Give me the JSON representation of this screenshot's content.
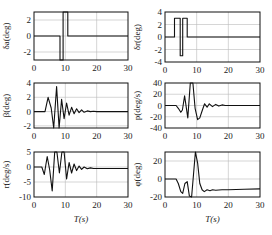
{
  "chart_data": [
    {
      "type": "line",
      "panel": "top-left",
      "ylabel": "δa(deg)",
      "xlabel": "",
      "xlim": [
        0,
        30
      ],
      "ylim": [
        -3,
        3
      ],
      "xticks": [
        "0",
        "10",
        "20",
        "30"
      ],
      "yticks": [
        "2",
        "0",
        "-2"
      ],
      "grid": true,
      "series": [
        {
          "name": "delta_a",
          "x": [
            0,
            8.3,
            8.3,
            9.3,
            9.3,
            9.8,
            9.8,
            10.8,
            10.8,
            30
          ],
          "y": [
            0,
            0,
            -3,
            -3,
            3,
            3,
            3,
            3,
            0,
            0
          ]
        }
      ]
    },
    {
      "type": "line",
      "panel": "top-right",
      "ylabel": "δr(deg)",
      "xlabel": "",
      "xlim": [
        0,
        30
      ],
      "ylim": [
        -4,
        4
      ],
      "xticks": [
        "0",
        "10",
        "20",
        "30"
      ],
      "yticks": [
        "4",
        "2",
        "0",
        "-2",
        "-4"
      ],
      "grid": true,
      "series": [
        {
          "name": "delta_r",
          "x": [
            0,
            3,
            3,
            4.8,
            4.8,
            5.6,
            5.6,
            6.3,
            6.3,
            7,
            7,
            30
          ],
          "y": [
            0,
            0,
            3,
            3,
            -3,
            -3,
            3,
            3,
            3,
            3,
            0,
            0
          ]
        }
      ]
    },
    {
      "type": "line",
      "panel": "middle-left",
      "ylabel": "β(deg)",
      "xlabel": "",
      "xlim": [
        0,
        30
      ],
      "ylim": [
        -2.3,
        4
      ],
      "xticks": [
        "0",
        "10",
        "20",
        "30"
      ],
      "yticks": [
        "4",
        "2",
        "0",
        "-2"
      ],
      "grid": true,
      "series": [
        {
          "name": "beta",
          "x": [
            0,
            3.5,
            4.5,
            5.5,
            6.3,
            7.2,
            8.0,
            8.8,
            9.6,
            10.4,
            11.2,
            12,
            12.8,
            13.6,
            14.4,
            15.2,
            16,
            17,
            18,
            19,
            20,
            30
          ],
          "y": [
            0,
            0,
            2,
            0.5,
            -2.3,
            3.5,
            -2.3,
            1.7,
            -1.0,
            1.2,
            -0.5,
            0.6,
            -0.3,
            0.4,
            -0.15,
            0.25,
            -0.1,
            0.1,
            0,
            0.05,
            0,
            0
          ]
        }
      ]
    },
    {
      "type": "line",
      "panel": "middle-right",
      "ylabel": "p(deg/s)",
      "xlabel": "",
      "xlim": [
        0,
        30
      ],
      "ylim": [
        -40,
        40
      ],
      "xticks": [
        "0",
        "10",
        "20",
        "30"
      ],
      "yticks": [
        "40",
        "20",
        "0",
        "-20",
        "-40"
      ],
      "grid": true,
      "series": [
        {
          "name": "p",
          "x": [
            0,
            3.5,
            4.2,
            5,
            5.5,
            6.2,
            7.2,
            8,
            8.8,
            9.5,
            10.3,
            11,
            11.8,
            12.5,
            13.3,
            14,
            15,
            16,
            17,
            18,
            19,
            20,
            30
          ],
          "y": [
            0,
            0,
            -5,
            -12,
            -8,
            17,
            -22,
            40,
            40,
            -5,
            -25,
            -22,
            -8,
            3,
            -3,
            3,
            -2,
            2,
            -1,
            1,
            0,
            0,
            0
          ]
        }
      ]
    },
    {
      "type": "line",
      "panel": "bottom-left",
      "ylabel": "r(deg/s)",
      "xlabel": "T(s)",
      "xlim": [
        0,
        30
      ],
      "ylim": [
        -10,
        5
      ],
      "xticks": [
        "0",
        "10",
        "20",
        "30"
      ],
      "yticks": [
        "5",
        "0",
        "-5",
        "-10"
      ],
      "grid": true,
      "series": [
        {
          "name": "r",
          "x": [
            0,
            2.5,
            3.3,
            4.2,
            5.0,
            5.8,
            6.6,
            7.3,
            8.1,
            8.9,
            9.6,
            10.4,
            11.2,
            12,
            12.8,
            13.6,
            14.4,
            15.2,
            16,
            17,
            18,
            19,
            20,
            30
          ],
          "y": [
            0,
            0,
            -2.5,
            3.5,
            -1,
            -8,
            5,
            5,
            -2,
            5,
            5,
            -4,
            1.5,
            -2,
            1,
            -1.2,
            0.3,
            -0.8,
            0,
            -0.6,
            -0.3,
            -0.5,
            -0.5,
            -0.5
          ]
        }
      ]
    },
    {
      "type": "line",
      "panel": "bottom-right",
      "ylabel": "φ(deg)",
      "xlabel": "T(s)",
      "xlim": [
        0,
        30
      ],
      "ylim": [
        -20,
        30
      ],
      "xticks": [
        "0",
        "10",
        "20",
        "30"
      ],
      "yticks": [
        "20",
        "0",
        "-20"
      ],
      "grid": true,
      "series": [
        {
          "name": "phi",
          "x": [
            0,
            3.5,
            4.2,
            5,
            5.6,
            6.3,
            7,
            7.7,
            8.4,
            9,
            9.6,
            10.3,
            11,
            11.7,
            12.4,
            13.3,
            14.2,
            15,
            16,
            18,
            20,
            25,
            30
          ],
          "y": [
            0,
            0,
            -5,
            -14,
            -16,
            -5,
            -3,
            -19,
            -20,
            5,
            30,
            18,
            -5,
            -12,
            -14,
            -12,
            -13,
            -12,
            -12.5,
            -12,
            -12,
            -11.5,
            -11
          ]
        }
      ]
    }
  ],
  "panels": {
    "top_left": {
      "ylabel_sym": "δ",
      "ylabel_sub": "a",
      "ylabel_unit": "(deg)"
    },
    "top_right": {
      "ylabel_sym": "δ",
      "ylabel_sub": "r",
      "ylabel_unit": "(deg)"
    },
    "middle_left": {
      "ylabel": "β(deg)"
    },
    "middle_right": {
      "ylabel": "p(deg/s)"
    },
    "bottom_left": {
      "ylabel": "r(deg/s)",
      "xlabel": "T(s)"
    },
    "bottom_right": {
      "ylabel": "φ(deg)",
      "xlabel": "T(s)"
    }
  },
  "colors": {
    "line": "#111111",
    "grid": "#bbbbbb",
    "frame": "#111111"
  }
}
